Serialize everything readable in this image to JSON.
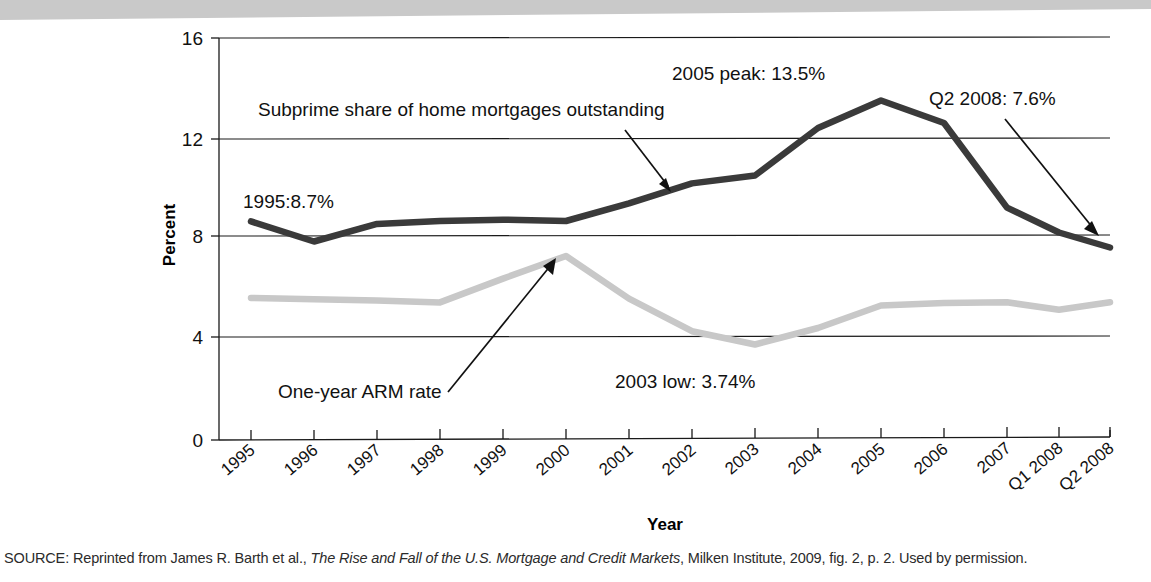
{
  "chart_data": {
    "type": "line",
    "title": "",
    "xlabel": "Year",
    "ylabel": "Percent",
    "ylim": [
      0,
      16
    ],
    "yticks": [
      0,
      4,
      8,
      12,
      16
    ],
    "grid": "horizontal",
    "legend": "none (inline labels)",
    "categories": [
      "1995",
      "1996",
      "1997",
      "1998",
      "1999",
      "2000",
      "2001",
      "2002",
      "2003",
      "2004",
      "2005",
      "2006",
      "2007",
      "Q1 2008",
      "Q2 2008"
    ],
    "series": [
      {
        "name": "Subprime share of home mortgages outstanding",
        "color": "#3a3a3a",
        "values": [
          8.7,
          7.9,
          8.6,
          8.7,
          8.75,
          8.7,
          9.4,
          10.2,
          10.5,
          12.4,
          13.5,
          12.6,
          9.2,
          8.2,
          7.6
        ]
      },
      {
        "name": "One-year ARM rate",
        "color": "#c8c8c8",
        "values": [
          5.65,
          5.6,
          5.55,
          5.45,
          6.4,
          7.3,
          5.6,
          4.3,
          3.74,
          4.4,
          5.3,
          5.4,
          5.4,
          5.1,
          5.4
        ]
      }
    ],
    "annotations": [
      {
        "id": "series-label-subprime",
        "text": "Subprime share of home mortgages outstanding"
      },
      {
        "id": "series-label-arm",
        "text": "One-year ARM rate"
      },
      {
        "id": "callout-1995",
        "text": "1995:8.7%"
      },
      {
        "id": "callout-2005-peak",
        "text": "2005 peak: 13.5%"
      },
      {
        "id": "callout-q2-2008",
        "text": "Q2 2008: 7.6%"
      },
      {
        "id": "callout-2003-low",
        "text": "2003 low: 3.74%"
      }
    ]
  },
  "source": {
    "prefix": "SOURCE: Reprinted from James R. Barth et al., ",
    "italic_title": "The Rise and Fall of the U.S. Mortgage and Credit Markets",
    "suffix": ", Milken Institute, 2009, fig. 2, p. 2. Used by permission."
  }
}
